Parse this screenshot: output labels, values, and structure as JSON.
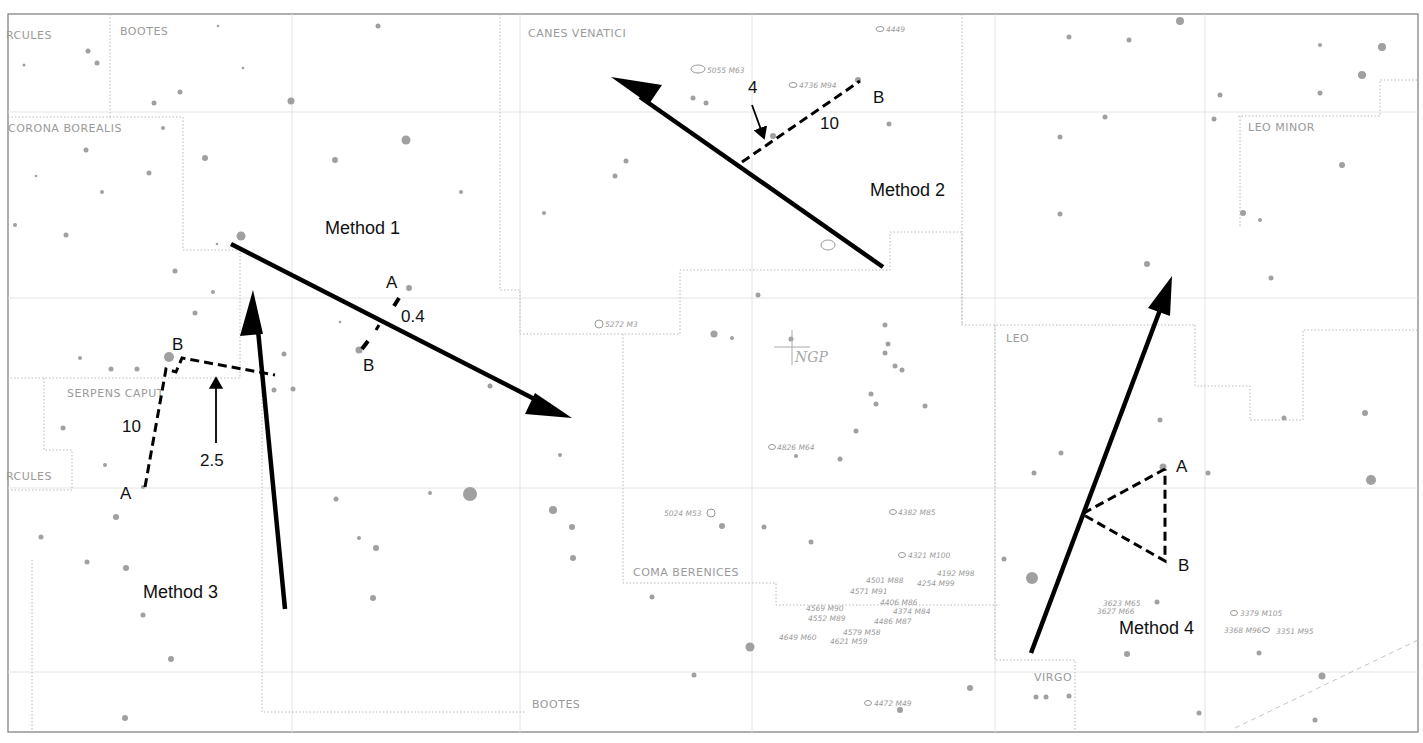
{
  "chart": {
    "frame": {
      "x": 8,
      "y": 14,
      "w": 1410,
      "h": 718
    },
    "constellations": [
      {
        "label": "RCULES",
        "x": 6,
        "y": 39
      },
      {
        "label": "BOOTES",
        "x": 120,
        "y": 35
      },
      {
        "label": "CORONA  BOREALIS",
        "x": 8,
        "y": 132
      },
      {
        "label": "CANES  VENATICI",
        "x": 528,
        "y": 37
      },
      {
        "label": "LEO MINOR",
        "x": 1248,
        "y": 131
      },
      {
        "label": "LEO",
        "x": 1006,
        "y": 342
      },
      {
        "label": "SERPENS CAPUT",
        "x": 67,
        "y": 397
      },
      {
        "label": "RCULES",
        "x": 6,
        "y": 480
      },
      {
        "label": "COMA BERENICES",
        "x": 633,
        "y": 576
      },
      {
        "label": "BOOTES",
        "x": 532,
        "y": 708
      },
      {
        "label": "VIRGO",
        "x": 1034,
        "y": 681
      }
    ],
    "ngp_label": "NGP",
    "deep_sky": [
      {
        "label": "4449",
        "x": 883,
        "y": 29
      },
      {
        "label": "5055 M63",
        "x": 706,
        "y": 70
      },
      {
        "label": "4736 M94",
        "x": 800,
        "y": 85
      },
      {
        "label": "5272 M3",
        "x": 603,
        "y": 325
      },
      {
        "label": "4826 M64",
        "x": 775,
        "y": 448
      },
      {
        "label": "5024 M53",
        "x": 704,
        "y": 513
      },
      {
        "label": "4382 M85",
        "x": 896,
        "y": 512
      },
      {
        "label": "4321 M100",
        "x": 906,
        "y": 555
      },
      {
        "label": "4192 M98",
        "x": 935,
        "y": 573
      },
      {
        "label": "4501 M88",
        "x": 866,
        "y": 580
      },
      {
        "label": "4254 M99",
        "x": 917,
        "y": 583
      },
      {
        "label": "4571 M91",
        "x": 848,
        "y": 591
      },
      {
        "label": "4406 M86",
        "x": 880,
        "y": 603
      },
      {
        "label": "4374 M84",
        "x": 888,
        "y": 611
      },
      {
        "label": "4569 M90",
        "x": 845,
        "y": 606
      },
      {
        "label": "4552 M89",
        "x": 848,
        "y": 618
      },
      {
        "label": "4486 M87",
        "x": 874,
        "y": 621
      },
      {
        "label": "4579 M58",
        "x": 843,
        "y": 632
      },
      {
        "label": "4649 M60",
        "x": 818,
        "y": 637
      },
      {
        "label": "4621 M59",
        "x": 830,
        "y": 641
      },
      {
        "label": "4472 M49",
        "x": 872,
        "y": 703
      },
      {
        "label": "3623 M65",
        "x": 1138,
        "y": 603
      },
      {
        "label": "3627 M66",
        "x": 1133,
        "y": 611
      },
      {
        "label": "3379 M105",
        "x": 1265,
        "y": 613
      },
      {
        "label": "3368 M96",
        "x": 1243,
        "y": 630
      },
      {
        "label": "3351 M95",
        "x": 1280,
        "y": 632
      }
    ],
    "methods": [
      {
        "name": "method-1",
        "title": "Method 1",
        "title_x": 325,
        "title_y": 234,
        "labels": [
          {
            "text": "A",
            "x": 386,
            "y": 288
          },
          {
            "text": "0.4",
            "x": 401,
            "y": 322
          },
          {
            "text": "B",
            "x": 363,
            "y": 371
          }
        ]
      },
      {
        "name": "method-2",
        "title": "Method 2",
        "title_x": 870,
        "title_y": 196,
        "labels": [
          {
            "text": "4",
            "x": 748,
            "y": 93
          },
          {
            "text": "B",
            "x": 873,
            "y": 103
          },
          {
            "text": "10",
            "x": 820,
            "y": 129
          }
        ]
      },
      {
        "name": "method-3",
        "title": "Method 3",
        "title_x": 143,
        "title_y": 598,
        "labels": [
          {
            "text": "B",
            "x": 172,
            "y": 350
          },
          {
            "text": "10",
            "x": 122,
            "y": 432
          },
          {
            "text": "2.5",
            "x": 200,
            "y": 466
          },
          {
            "text": "A",
            "x": 120,
            "y": 499
          }
        ]
      },
      {
        "name": "method-4",
        "title": "Method 4",
        "title_x": 1119,
        "title_y": 634,
        "labels": [
          {
            "text": "A",
            "x": 1176,
            "y": 472
          },
          {
            "text": "B",
            "x": 1178,
            "y": 571
          }
        ]
      }
    ]
  }
}
